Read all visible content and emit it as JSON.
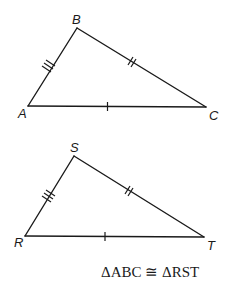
{
  "diagram": {
    "type": "congruent-triangles",
    "caption": "ΔABC ≅ ΔRST",
    "colors": {
      "stroke": "#1a1a1a",
      "background": "#ffffff"
    },
    "triangles": [
      {
        "name": "ABC",
        "vertices": [
          {
            "label": "A",
            "x": 28,
            "y": 106
          },
          {
            "label": "B",
            "x": 77,
            "y": 28
          },
          {
            "label": "C",
            "x": 206,
            "y": 107
          }
        ],
        "sides": [
          {
            "name": "AB",
            "ticks": 3
          },
          {
            "name": "BC",
            "ticks": 2
          },
          {
            "name": "AC",
            "ticks": 1
          }
        ]
      },
      {
        "name": "RST",
        "vertices": [
          {
            "label": "R",
            "x": 25,
            "y": 236
          },
          {
            "label": "S",
            "x": 74,
            "y": 156
          },
          {
            "label": "T",
            "x": 204,
            "y": 237
          }
        ],
        "sides": [
          {
            "name": "RS",
            "ticks": 3
          },
          {
            "name": "ST",
            "ticks": 2
          },
          {
            "name": "RT",
            "ticks": 1
          }
        ]
      }
    ]
  }
}
